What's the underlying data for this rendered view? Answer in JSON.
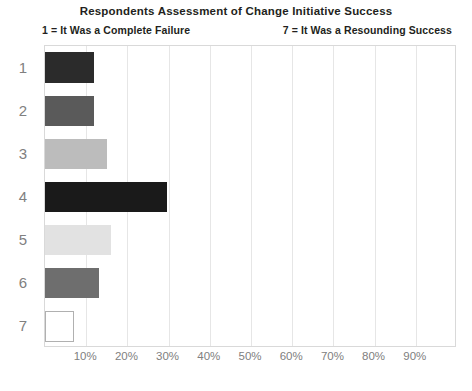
{
  "chart_data": {
    "type": "bar",
    "orientation": "horizontal",
    "title": "Respondents Assessment of Change Initiative Success",
    "subtitle_left": "1 = It Was a Complete Failure",
    "subtitle_right": "7 = It Was a Resounding Success",
    "xlabel": "",
    "ylabel": "",
    "categories": [
      "1",
      "2",
      "3",
      "4",
      "5",
      "6",
      "7"
    ],
    "values": [
      12,
      12,
      15,
      29.5,
      16,
      13,
      7
    ],
    "value_labels": [
      "12%",
      "12%",
      "15%",
      "29.5%",
      "16%",
      "13%",
      "7%"
    ],
    "xlim": [
      0,
      100
    ],
    "ylim": null,
    "x_tick_labels": [
      "10%",
      "20%",
      "30%",
      "40%",
      "50%",
      "60%",
      "70%",
      "80%",
      "90%"
    ],
    "x_tick_values": [
      10,
      20,
      30,
      40,
      50,
      60,
      70,
      80,
      90
    ],
    "grid": true,
    "grid_axis": "x",
    "legend": false,
    "legend_position": "none",
    "bar_colors": [
      "#2b2b2b",
      "#5a5a5a",
      "#bcbcbc",
      "#1a1a1a",
      "#e2e2e2",
      "#6e6e6e",
      "#ffffff"
    ],
    "bar_border_colors": [
      "#2b2b2b",
      "#5a5a5a",
      "#bcbcbc",
      "#1a1a1a",
      "#e2e2e2",
      "#6e6e6e",
      "#b0b0b0"
    ],
    "plot_background": "#ffffff",
    "gridline_color": "#e6e6e6",
    "axis_border_color": "#d9d9d9",
    "tick_label_color": "#808080",
    "title_color": "#231f20"
  }
}
